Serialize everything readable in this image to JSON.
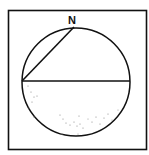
{
  "diagram": {
    "north_label": "N",
    "colors": {
      "stroke": "#111111",
      "background": "#ffffff",
      "stipple": "#888888"
    },
    "frame": {
      "x": 8,
      "y": 10,
      "width": 139,
      "height": 140
    },
    "circle": {
      "cx": 76,
      "cy": 82,
      "r": 54
    },
    "diameter": {
      "x1": 22,
      "y1": 81,
      "x2": 130,
      "y2": 81
    },
    "chord": {
      "x1": 22,
      "y1": 81,
      "x2": 74,
      "y2": 27
    },
    "stipple_region": "lower-half"
  }
}
